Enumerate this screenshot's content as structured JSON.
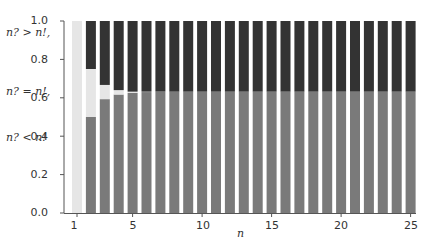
{
  "chart_data": {
    "type": "bar",
    "stacked": true,
    "title": "",
    "xlabel": "n",
    "ylabel": "",
    "ylim": [
      0,
      1.0
    ],
    "yticks": [
      "0.0",
      "0.2",
      "0.4",
      "0.6",
      "0.8",
      "1.0"
    ],
    "xticks": [
      "1",
      "5",
      "10",
      "15",
      "20",
      "25"
    ],
    "grid": false,
    "legend_position": "left-side labels",
    "categories": [
      1,
      2,
      3,
      4,
      5,
      6,
      7,
      8,
      9,
      10,
      11,
      12,
      13,
      14,
      15,
      16,
      17,
      18,
      19,
      20,
      21,
      22,
      23,
      24,
      25
    ],
    "series": [
      {
        "name": "n? < n!",
        "color": "#7a7a7a",
        "values": [
          0,
          0.5,
          0.593,
          0.617,
          0.626,
          0.63,
          0.631,
          0.632,
          0.632,
          0.632,
          0.632,
          0.632,
          0.632,
          0.632,
          0.632,
          0.632,
          0.632,
          0.632,
          0.632,
          0.632,
          0.632,
          0.632,
          0.632,
          0.632,
          0.632
        ]
      },
      {
        "name": "n? = n!",
        "color": "#e6e6e6",
        "values": [
          1.0,
          0.25,
          0.074,
          0.023,
          0.006,
          0.002,
          0.001,
          0,
          0,
          0,
          0,
          0,
          0,
          0,
          0,
          0,
          0,
          0,
          0,
          0,
          0,
          0,
          0,
          0,
          0
        ]
      },
      {
        "name": "n? > n!",
        "color": "#333333",
        "values": [
          0,
          0.25,
          0.333,
          0.36,
          0.368,
          0.368,
          0.368,
          0.368,
          0.368,
          0.368,
          0.368,
          0.368,
          0.368,
          0.368,
          0.368,
          0.368,
          0.368,
          0.368,
          0.368,
          0.368,
          0.368,
          0.368,
          0.368,
          0.368,
          0.368
        ]
      }
    ]
  },
  "labels": {
    "gt": "n? > n!,",
    "eq": "n? = n!,",
    "lt": "n? < n!",
    "xaxis": "n"
  }
}
